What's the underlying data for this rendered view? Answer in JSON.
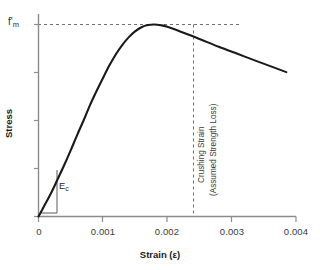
{
  "chart_data": {
    "type": "line",
    "title": "",
    "xlabel": "Strain (ε)",
    "ylabel": "Stress",
    "xlim": [
      0,
      0.004
    ],
    "ylim": [
      0,
      1.15
    ],
    "grid": false,
    "legend": "none",
    "xticks": [
      "0",
      "0.001",
      "0.002",
      "0.003",
      "0.004"
    ],
    "xtick_values": [
      0,
      0.001,
      0.002,
      0.003,
      0.004
    ],
    "yticks": [],
    "series": [
      {
        "name": "Masonry compressive stress-strain curve",
        "x": [
          0.0,
          0.0001,
          0.0002,
          0.0003,
          0.0004,
          0.0005,
          0.0006,
          0.0007,
          0.0008,
          0.0009,
          0.001,
          0.0011,
          0.0012,
          0.0013,
          0.0014,
          0.0015,
          0.0016,
          0.0017,
          0.0018,
          0.0019,
          0.002,
          0.0022,
          0.0025,
          0.0028,
          0.0031,
          0.0034,
          0.00385
        ],
        "y": [
          0.0,
          0.062,
          0.125,
          0.196,
          0.268,
          0.344,
          0.424,
          0.5,
          0.58,
          0.652,
          0.72,
          0.786,
          0.844,
          0.893,
          0.933,
          0.964,
          0.986,
          0.997,
          1.0,
          0.996,
          0.988,
          0.964,
          0.925,
          0.884,
          0.846,
          0.808,
          0.752
        ]
      }
    ],
    "annotations": [
      {
        "name": "peak-stress-reference",
        "label": "f'm",
        "label_base": "f'",
        "label_sub": "m",
        "type": "horizontal-dashed-line",
        "y_value": 1.0,
        "x_from": 0.0,
        "x_to": 0.0032
      },
      {
        "name": "initial-modulus",
        "label": "Ec",
        "label_base": "E",
        "label_sub": "c",
        "type": "slope-triangle",
        "description": "Initial tangent modulus of elasticity"
      },
      {
        "name": "crushing-strain",
        "label_line1": "Crushing Strain",
        "label_line2": "(Assumed Strength Loss)",
        "type": "vertical-dashed-line",
        "x_value": 0.0025
      }
    ],
    "colors": {
      "curve": "#1a1a1a",
      "axis": "#808080",
      "dashed": "#6e6e6e",
      "text": "#3b3b3b",
      "background": "#ffffff"
    }
  },
  "labels": {
    "xaxis_title": "Strain (ε)",
    "yaxis_title": "Stress",
    "fm_base": "f'",
    "fm_sub": "m",
    "ec_base": "E",
    "ec_sub": "c",
    "crushing_strain": "Crushing Strain",
    "assumed_strength_loss": "(Assumed Strength Loss)",
    "xtick_0": "0",
    "xtick_1": "0.001",
    "xtick_2": "0.002",
    "xtick_3": "0.003",
    "xtick_4": "0.004"
  }
}
